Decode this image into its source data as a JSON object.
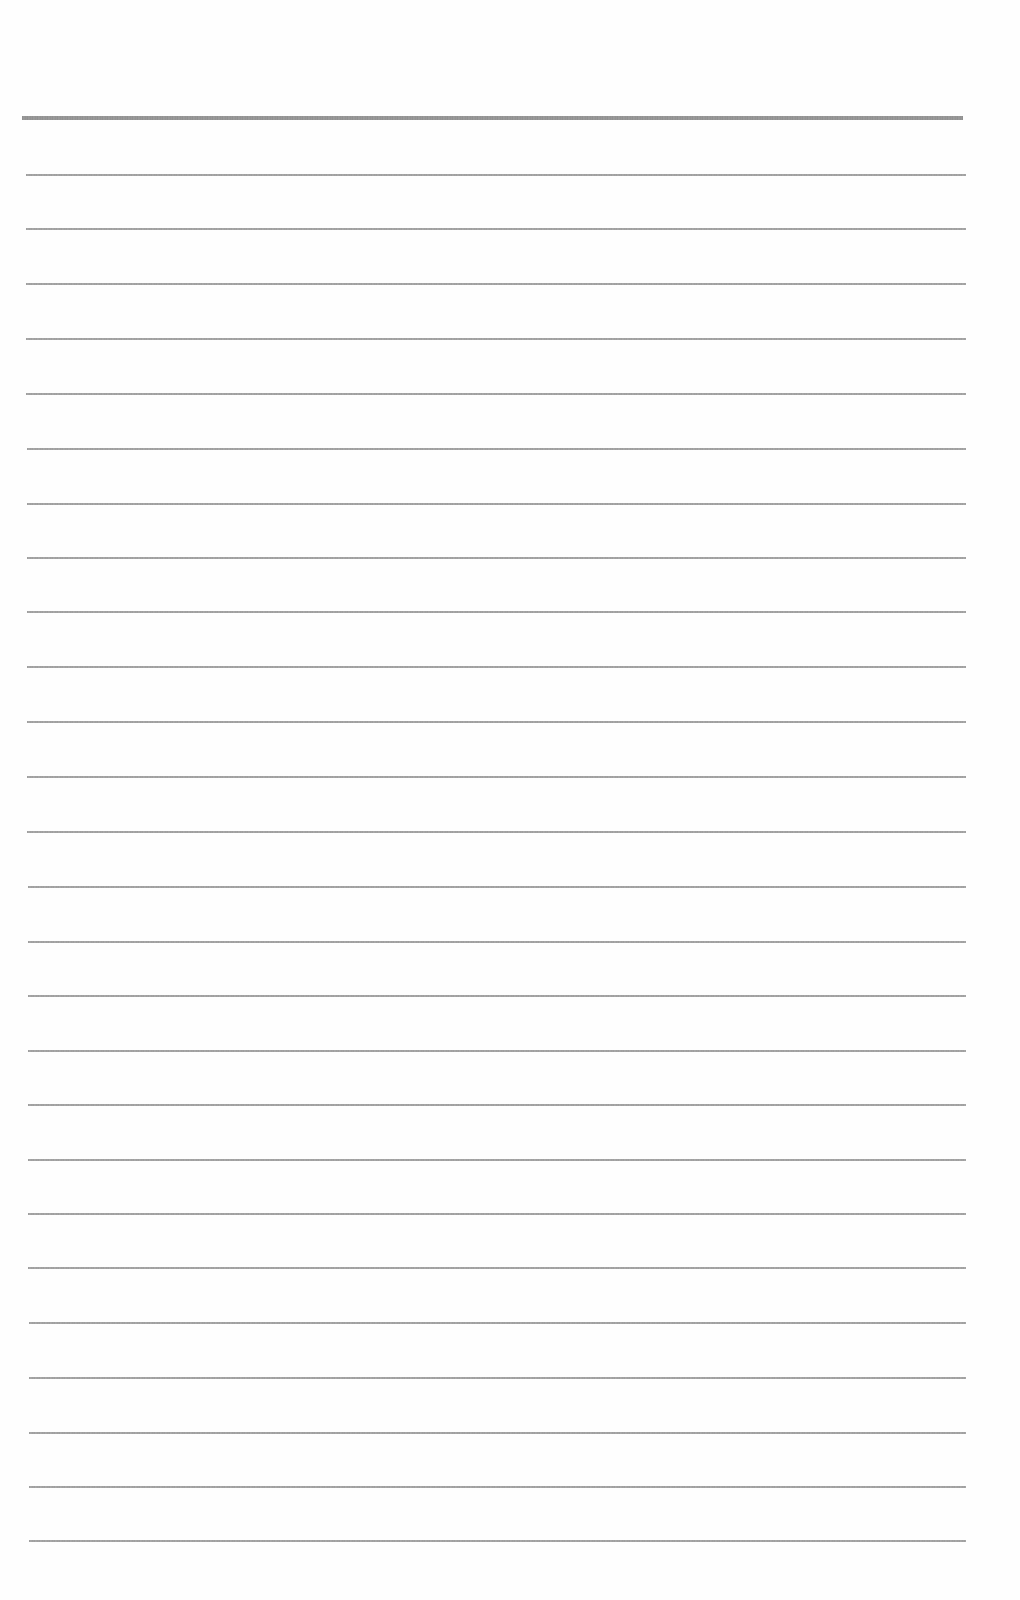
{
  "document": {
    "type": "ruled-notebook-page",
    "header_rule": {
      "y": 118,
      "thickness": 4,
      "x_start": 22,
      "x_end": 963,
      "color": "#8a8a8a"
    },
    "line_color": "#999999",
    "line_thickness": 2,
    "line_x_start": 26,
    "line_x_end": 966,
    "line_spacing": 54.5,
    "ruled_lines_y": [
      175,
      229,
      284,
      339,
      394,
      449,
      504,
      558,
      612,
      667,
      722,
      777,
      832,
      887,
      942,
      996,
      1051,
      1105,
      1160,
      1214,
      1268,
      1323,
      1378,
      1433,
      1487,
      1541
    ],
    "text_content": []
  }
}
